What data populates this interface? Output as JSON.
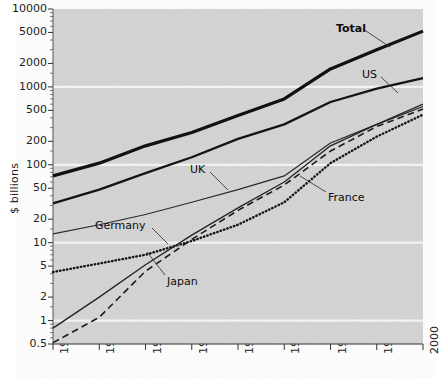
{
  "chart_data": {
    "type": "line",
    "title": "",
    "xlabel": "",
    "ylabel": "$ billions",
    "yscale": "log",
    "ylim": [
      0.5,
      10000
    ],
    "xlim": [
      1960,
      2000
    ],
    "grid": true,
    "grid_color": "#f2f2f2",
    "plot_background": "#d4d4d4",
    "legend": "inline annotations with leader lines",
    "yticks": [
      {
        "value": 10000,
        "label": "10000"
      },
      {
        "value": 5000,
        "label": "5000"
      },
      {
        "value": 2000,
        "label": "2000"
      },
      {
        "value": 1000,
        "label": "1000"
      },
      {
        "value": 500,
        "label": "500"
      },
      {
        "value": 200,
        "label": "200"
      },
      {
        "value": 100,
        "label": "100"
      },
      {
        "value": 50,
        "label": "50"
      },
      {
        "value": 20,
        "label": "20"
      },
      {
        "value": 10,
        "label": "10"
      },
      {
        "value": 5,
        "label": "5"
      },
      {
        "value": 2,
        "label": "2"
      },
      {
        "value": 1,
        "label": "1"
      },
      {
        "value": 0.5,
        "label": "0.5"
      }
    ],
    "gridlines": [
      1000,
      100,
      10,
      1
    ],
    "xticks": [
      {
        "value": 1960,
        "label": "1960"
      },
      {
        "value": 1965,
        "label": "1965"
      },
      {
        "value": 1970,
        "label": "1970"
      },
      {
        "value": 1975,
        "label": "1975"
      },
      {
        "value": 1980,
        "label": "1980"
      },
      {
        "value": 1985,
        "label": "1985"
      },
      {
        "value": 1990,
        "label": "1990"
      },
      {
        "value": 1995,
        "label": "1995"
      },
      {
        "value": 2000,
        "label": "2000"
      }
    ],
    "x": [
      1960,
      1965,
      1970,
      1975,
      1980,
      1985,
      1990,
      1995,
      2000
    ],
    "series": [
      {
        "name": "Total",
        "label": "Total",
        "style": "solid",
        "width": 3.2,
        "color": "#111111",
        "values": [
          72,
          105,
          175,
          260,
          430,
          700,
          1700,
          3000,
          5200
        ],
        "label_pos": {
          "x": 336,
          "y": 23
        },
        "leader": [
          [
            363,
            29
          ],
          [
            390,
            47
          ]
        ]
      },
      {
        "name": "US",
        "label": "US",
        "style": "solid",
        "width": 2.3,
        "color": "#141414",
        "values": [
          32,
          48,
          78,
          125,
          215,
          330,
          640,
          950,
          1300
        ],
        "label_pos": {
          "x": 362,
          "y": 69
        },
        "leader": [
          [
            381,
            77
          ],
          [
            398,
            93
          ]
        ]
      },
      {
        "name": "UK",
        "label": "UK",
        "style": "solid",
        "width": 1.2,
        "color": "#2a2a2a",
        "values": [
          13,
          17,
          23,
          33,
          48,
          72,
          190,
          330,
          600
        ],
        "label_pos": {
          "x": 190,
          "y": 164
        },
        "leader": [
          [
            210,
            172
          ],
          [
            228,
            190
          ]
        ]
      },
      {
        "name": "France",
        "label": "France",
        "style": "dotted",
        "width": 2.4,
        "color": "#161616",
        "values": [
          4.2,
          5.4,
          7.0,
          10.5,
          17,
          33,
          105,
          230,
          440
        ],
        "label_pos": {
          "x": 328,
          "y": 192
        },
        "leader": [
          [
            326,
            192
          ],
          [
            300,
            176
          ]
        ]
      },
      {
        "name": "Germany",
        "label": "Germany",
        "style": "solid",
        "width": 1.3,
        "color": "#222222",
        "values": [
          0.8,
          2.0,
          5.2,
          12.5,
          28,
          60,
          175,
          330,
          560
        ],
        "label_pos": {
          "x": 95,
          "y": 220
        },
        "leader": [
          [
            152,
            228
          ],
          [
            168,
            244
          ]
        ]
      },
      {
        "name": "Japan",
        "label": "Japan",
        "style": "dashed",
        "width": 1.6,
        "color": "#1c1c1c",
        "values": [
          0.52,
          1.1,
          4.3,
          11.0,
          26,
          55,
          150,
          310,
          520
        ],
        "label_pos": {
          "x": 167,
          "y": 276
        },
        "leader": [
          [
            165,
            275
          ],
          [
            147,
            252
          ]
        ]
      }
    ]
  }
}
